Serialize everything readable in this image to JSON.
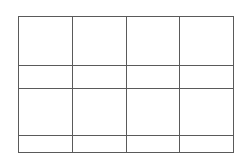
{
  "grid": {
    "columns": 4,
    "rows": 4,
    "line_color": "#5a5a5a",
    "background": "#ffffff",
    "column_widths": [
      54,
      54,
      53,
      54
    ],
    "row_heights": [
      49,
      23,
      47,
      17
    ],
    "cells": [
      [
        "",
        "",
        "",
        ""
      ],
      [
        "",
        "",
        "",
        ""
      ],
      [
        "",
        "",
        "",
        ""
      ],
      [
        "",
        "",
        "",
        ""
      ]
    ]
  }
}
